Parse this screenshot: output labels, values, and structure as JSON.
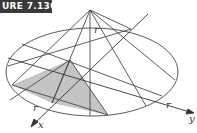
{
  "figure": {
    "label": "URE 7.130",
    "colors": {
      "stroke": "#4a4a4a",
      "shade": "#c4c4c4",
      "label_bg": "#3a3a3a"
    }
  },
  "labels": {
    "r_top": "r",
    "r_left": "r",
    "r_right": "r",
    "axis_x": "x",
    "axis_y": "y"
  }
}
